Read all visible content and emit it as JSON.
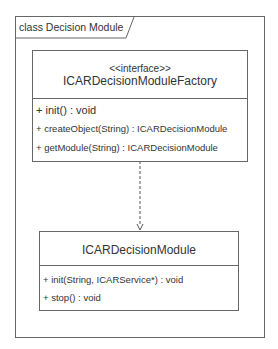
{
  "frame": {
    "label": "class Decision Module"
  },
  "interface_box": {
    "stereotype": "<<interface>>",
    "name": "ICARDecisionModuleFactory",
    "operations": [
      "+ init() : void",
      "+ createObject(String) : ICARDecisionModule",
      "+ getModule(String) : ICARDecisionModule"
    ]
  },
  "class_box": {
    "name": "ICARDecisionModule",
    "operations": [
      "+ init(String, ICARService*) : void",
      "+ stop() : void"
    ]
  },
  "relationship": {
    "type": "dependency",
    "from": "ICARDecisionModuleFactory",
    "to": "ICARDecisionModule",
    "style": "dashed"
  },
  "colors": {
    "line": "#666666",
    "text": "#333333",
    "background": "#ffffff"
  }
}
